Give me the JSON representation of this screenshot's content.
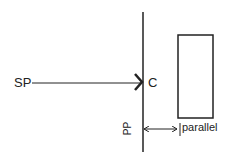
{
  "diagram": {
    "labels": {
      "source": "SP",
      "contact": "C",
      "plane": "PP",
      "relation": "parallel"
    },
    "colors": {
      "stroke": "#222222",
      "background": "#ffffff"
    }
  }
}
